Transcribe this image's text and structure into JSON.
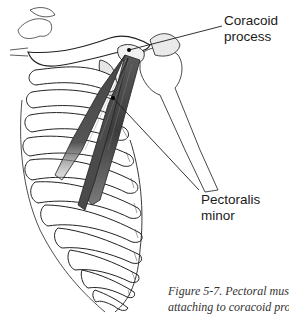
{
  "figure": {
    "labels": {
      "coracoid": {
        "line1": "Coracoid",
        "line2": "process"
      },
      "pectoralis": {
        "line1": "Pectoralis",
        "line2": "minor"
      }
    },
    "caption": {
      "line1": "Figure 5-7. Pectoral muscle",
      "line2": "attaching to coracoid process."
    },
    "colors": {
      "muscle_dark": "#3a3a3a",
      "muscle_mid": "#6b6b6b",
      "bone_outline": "#222222",
      "bone_fill": "#ffffff",
      "bone_shade": "#e6e6e6"
    }
  }
}
